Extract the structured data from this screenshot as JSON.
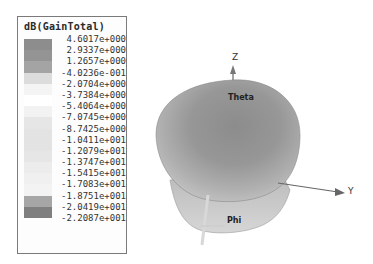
{
  "legend": {
    "title": "dB(GainTotal)",
    "entries": [
      {
        "value": "4.6017e+000",
        "color": "#8d8d8d"
      },
      {
        "value": "2.9337e+000",
        "color": "#949494"
      },
      {
        "value": "1.2657e+000",
        "color": "#a4a4a4"
      },
      {
        "value": "-4.0236e-001",
        "color": "#dcdcdc"
      },
      {
        "value": "-2.0704e+000",
        "color": "#f4f4f4"
      },
      {
        "value": "-3.7384e+000",
        "color": "#ffffff"
      },
      {
        "value": "-5.4064e+000",
        "color": "#f2f2f2"
      },
      {
        "value": "-7.0745e+000",
        "color": "#e6e6e6"
      },
      {
        "value": "-8.7425e+000",
        "color": "#e3e3e3"
      },
      {
        "value": "-1.0411e+001",
        "color": "#e3e3e3"
      },
      {
        "value": "-1.2079e+001",
        "color": "#e6e6e6"
      },
      {
        "value": "-1.3747e+001",
        "color": "#ececec"
      },
      {
        "value": "-1.5415e+001",
        "color": "#f0f0f0"
      },
      {
        "value": "-1.7083e+001",
        "color": "#f3f3f3"
      },
      {
        "value": "-1.8751e+001",
        "color": "#a6a6a6"
      },
      {
        "value": "-2.0419e+001",
        "color": "#7f7f7f"
      },
      {
        "value": "-2.2087e+001",
        "color": "#7f7f7f"
      }
    ]
  },
  "plot": {
    "axes": {
      "z": "Z",
      "y": "Y"
    },
    "angle_labels": {
      "theta": "Theta",
      "phi": "Phi"
    },
    "surface_colors": {
      "dark": "#8a8a8a",
      "mid": "#a8a8a8",
      "light": "#cfcfcf"
    }
  }
}
